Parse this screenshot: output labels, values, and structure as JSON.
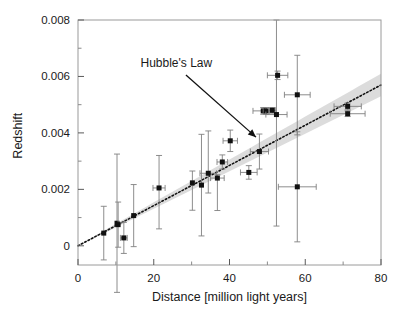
{
  "chart_data": {
    "type": "scatter",
    "title": "",
    "xlabel": "Distance [million light years]",
    "ylabel": "Redshift",
    "xlim": [
      0,
      80
    ],
    "ylim": [
      -0.00068,
      0.008
    ],
    "grid": false,
    "legend_position": "none",
    "xticks": [
      0,
      20,
      40,
      60,
      80
    ],
    "xticklabels": [
      "0",
      "20",
      "40",
      "60",
      "80"
    ],
    "xminorticks": [
      10,
      30,
      50,
      70
    ],
    "yticks": [
      0,
      0.002,
      0.004,
      0.006,
      0.008
    ],
    "yticklabels": [
      "0",
      "0.002",
      "0.004",
      "0.006",
      "0.008"
    ],
    "yminorticks": [
      0.001,
      0.003,
      0.005,
      0.007
    ],
    "annotations": [
      {
        "text": "Hubble's Law",
        "text_x": 16.5,
        "text_y": 0.00635,
        "arrow_from_x": 28.5,
        "arrow_from_y": 0.00605,
        "arrow_to_x": 47.0,
        "arrow_to_y": 0.00385
      }
    ],
    "fit_line": {
      "label": "Hubble's Law",
      "style": "dotted",
      "intercept": 0.0,
      "slope": 7.12e-05,
      "x_start": 0,
      "x_end": 80,
      "color": "#111111"
    },
    "confidence_band": {
      "color": "#d0d0d0",
      "opacity": 0.75,
      "x_start": 0,
      "x_end": 80,
      "half_width_at_start": 2e-05,
      "half_width_at_end": 0.0004
    },
    "marker": {
      "shape": "square",
      "color": "#111111",
      "size_px": 5
    },
    "errorbar_color": "#808080",
    "points": [
      {
        "x": 6.8,
        "y": 0.00045,
        "xerr_lo": 0.0,
        "xerr_hi": 0.0,
        "yerr_lo": 0.00095,
        "yerr_hi": 0.00095
      },
      {
        "x": 10.3,
        "y": 0.0008,
        "xerr_lo": 0.0,
        "xerr_hi": 0.0,
        "yerr_lo": 0.00245,
        "yerr_hi": 0.00245
      },
      {
        "x": 10.6,
        "y": 0.00075,
        "xerr_lo": 0.0,
        "xerr_hi": 0.0,
        "yerr_lo": 0.0008,
        "yerr_hi": 0.0008
      },
      {
        "x": 12.1,
        "y": 0.00028,
        "xerr_lo": 0.9,
        "xerr_hi": 0.9,
        "yerr_lo": 0.00055,
        "yerr_hi": 0.00055
      },
      {
        "x": 14.7,
        "y": 0.00107,
        "xerr_lo": 0.0,
        "xerr_hi": 0.0,
        "yerr_lo": 0.0011,
        "yerr_hi": 0.0011
      },
      {
        "x": 21.4,
        "y": 0.00205,
        "xerr_lo": 1.6,
        "xerr_hi": 1.6,
        "yerr_lo": 0.00145,
        "yerr_hi": 0.00115
      },
      {
        "x": 30.2,
        "y": 0.00223,
        "xerr_lo": 0.0,
        "xerr_hi": 0.0,
        "yerr_lo": 0.00097,
        "yerr_hi": 0.00042
      },
      {
        "x": 32.6,
        "y": 0.00215,
        "xerr_lo": 0.0,
        "xerr_hi": 0.0,
        "yerr_lo": 0.0018,
        "yerr_hi": 0.0018
      },
      {
        "x": 34.4,
        "y": 0.00257,
        "xerr_lo": 2.2,
        "xerr_hi": 2.2,
        "yerr_lo": 0.0007,
        "yerr_hi": 0.0015
      },
      {
        "x": 36.8,
        "y": 0.0024,
        "xerr_lo": 1.8,
        "xerr_hi": 1.8,
        "yerr_lo": 0.00115,
        "yerr_hi": 0.00012
      },
      {
        "x": 38.1,
        "y": 0.00297,
        "xerr_lo": 1.4,
        "xerr_hi": 1.4,
        "yerr_lo": 0.00025,
        "yerr_hi": 0.00025
      },
      {
        "x": 40.2,
        "y": 0.00372,
        "xerr_lo": 1.9,
        "xerr_hi": 1.9,
        "yerr_lo": 0.00038,
        "yerr_hi": 0.00038
      },
      {
        "x": 45.1,
        "y": 0.0026,
        "xerr_lo": 2.2,
        "xerr_hi": 2.2,
        "yerr_lo": 0.00024,
        "yerr_hi": 0.00024
      },
      {
        "x": 47.9,
        "y": 0.00334,
        "xerr_lo": 2.4,
        "xerr_hi": 2.4,
        "yerr_lo": 0.00062,
        "yerr_hi": 0.00062
      },
      {
        "x": 48.9,
        "y": 0.00478,
        "xerr_lo": 2.7,
        "xerr_hi": 0.9,
        "yerr_lo": 0.00012,
        "yerr_hi": 0.00012
      },
      {
        "x": 49.7,
        "y": 0.00478,
        "xerr_lo": 0.8,
        "xerr_hi": 0.8,
        "yerr_lo": 0.00012,
        "yerr_hi": 0.00012
      },
      {
        "x": 51.3,
        "y": 0.0048,
        "xerr_lo": 0.9,
        "xerr_hi": 0.9,
        "yerr_lo": 0.0001,
        "yerr_hi": 0.0001
      },
      {
        "x": 52.4,
        "y": 0.00465,
        "xerr_lo": 2.8,
        "xerr_hi": 2.8,
        "yerr_lo": 0.00395,
        "yerr_hi": 0.00335
      },
      {
        "x": 52.7,
        "y": 0.00604,
        "xerr_lo": 2.7,
        "xerr_hi": 2.7,
        "yerr_lo": 0.00015,
        "yerr_hi": 0.00015
      },
      {
        "x": 57.9,
        "y": 0.00535,
        "xerr_lo": 3.4,
        "xerr_hi": 3.4,
        "yerr_lo": 0.00142,
        "yerr_hi": 0.0014
      },
      {
        "x": 57.9,
        "y": 0.00209,
        "xerr_lo": 5.0,
        "xerr_hi": 5.0,
        "yerr_lo": 0.00195,
        "yerr_hi": 0.00195
      },
      {
        "x": 71.2,
        "y": 0.00494,
        "xerr_lo": 3.6,
        "xerr_hi": 3.6,
        "yerr_lo": 0.00012,
        "yerr_hi": 0.00012
      },
      {
        "x": 71.2,
        "y": 0.00468,
        "xerr_lo": 4.6,
        "xerr_hi": 4.6,
        "yerr_lo": 0.0001,
        "yerr_hi": 0.0001
      }
    ]
  }
}
